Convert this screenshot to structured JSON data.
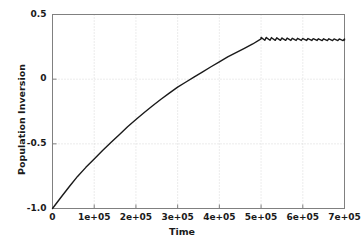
{
  "chart_data": {
    "type": "line",
    "title": "",
    "xlabel": "Time",
    "ylabel": "Population Inversion",
    "xlim": [
      0,
      700000
    ],
    "ylim": [
      -1.0,
      0.5
    ],
    "grid": true,
    "legend": null,
    "xticks": [
      0,
      100000,
      200000,
      300000,
      400000,
      500000,
      600000,
      700000
    ],
    "xtick_labels": [
      "0",
      "1e+05",
      "2e+05",
      "3e+05",
      "4e+05",
      "5e+05",
      "6e+05",
      "7e+05"
    ],
    "yticks": [
      0.5,
      0,
      -0.5,
      -1.0
    ],
    "ytick_labels": [
      "0.5",
      "0",
      "-0.5",
      "-1.0"
    ],
    "series": [
      {
        "name": "population inversion",
        "color": "#1a1a1a",
        "linewidth": 1.4,
        "description": "Monotonic saturating rise from -1.0 at t=0 to a steady plateau near 0.31 reached at t=5e+05, after which the trace shows small sawtooth relaxation oscillations about 0.31 out to t=7e+05.",
        "points": [
          [
            0,
            -1.0
          ],
          [
            20000,
            -0.915
          ],
          [
            40000,
            -0.832
          ],
          [
            60000,
            -0.752
          ],
          [
            80000,
            -0.682
          ],
          [
            100000,
            -0.618
          ],
          [
            120000,
            -0.552
          ],
          [
            140000,
            -0.49
          ],
          [
            160000,
            -0.43
          ],
          [
            180000,
            -0.368
          ],
          [
            200000,
            -0.312
          ],
          [
            220000,
            -0.258
          ],
          [
            240000,
            -0.206
          ],
          [
            260000,
            -0.155
          ],
          [
            280000,
            -0.108
          ],
          [
            300000,
            -0.062
          ],
          [
            320000,
            -0.022
          ],
          [
            340000,
            0.018
          ],
          [
            360000,
            0.056
          ],
          [
            380000,
            0.096
          ],
          [
            400000,
            0.134
          ],
          [
            420000,
            0.172
          ],
          [
            440000,
            0.205
          ],
          [
            460000,
            0.238
          ],
          [
            480000,
            0.272
          ],
          [
            500000,
            0.312
          ]
        ],
        "plateau_value": 0.312,
        "oscillation": {
          "start": 500000,
          "end": 700000,
          "shape": "sawtooth",
          "period": 12500,
          "amplitude": 0.022,
          "mean": 0.303
        }
      }
    ]
  },
  "axes": {
    "frame_color": "#808080",
    "grid_color": "#cfcfcf",
    "background": "#ffffff"
  }
}
